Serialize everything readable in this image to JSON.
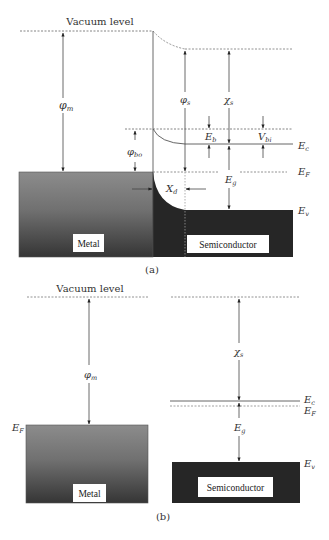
{
  "figure": {
    "panel_a": {
      "caption": "(a)",
      "vacuum_label": "Vacuum level",
      "metal_label": "Metal",
      "semiconductor_label": "Semiconductor",
      "symbols": {
        "phi_m": "φ",
        "phi_m_sub": "m",
        "phi_bo": "φ",
        "phi_bo_sub": "bo",
        "phi_s": "φ",
        "phi_s_sub": "s",
        "chi_s": "χ",
        "chi_s_sub": "s",
        "E_b": "E",
        "E_b_sub": "b",
        "V_bi": "V",
        "V_bi_sub": "bi",
        "E_c": "E",
        "E_c_sub": "c",
        "E_F": "E",
        "E_F_sub": "F",
        "E_g": "E",
        "E_g_sub": "g",
        "E_v": "E",
        "E_v_sub": "v",
        "X_d": "X",
        "X_d_sub": "d"
      }
    },
    "panel_b": {
      "caption": "(b)",
      "vacuum_label": "Vacuum level",
      "metal_label": "Metal",
      "semiconductor_label": "Semiconductor",
      "symbols": {
        "phi_m": "φ",
        "phi_m_sub": "m",
        "chi_s": "χ",
        "chi_s_sub": "s",
        "E_F_metal": "E",
        "E_F_metal_sub": "F",
        "E_c": "E",
        "E_c_sub": "c",
        "E_F": "E",
        "E_F_sub": "F",
        "E_g": "E",
        "E_g_sub": "g",
        "E_v": "E",
        "E_v_sub": "v"
      }
    },
    "colors": {
      "line": "#555555",
      "metal_top": "#8a8a8a",
      "metal_bottom": "#3a3a3a",
      "semiconductor_fill": "#262626",
      "label_box": "#ffffff"
    }
  }
}
